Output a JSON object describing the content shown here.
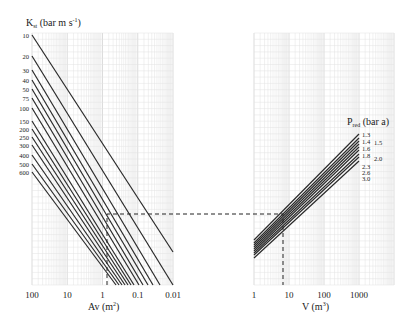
{
  "chart_data": [
    {
      "type": "line",
      "name": "left-panel",
      "title": "",
      "ylabel_main": "K",
      "ylabel_sub": "st",
      "ylabel_unit": "(bar m s",
      "ylabel_exp": "-1",
      "ylabel_close": ")",
      "xlabel_main": "Av (m",
      "xlabel_exp": "2",
      "xlabel_close": ")",
      "x_scale": "log",
      "x_reversed": true,
      "xlim": [
        100,
        0.01
      ],
      "x_ticks": [
        "100",
        "10",
        "1",
        "0.1",
        "0.01"
      ],
      "grid": true,
      "series_labels": [
        "10",
        "20",
        "30",
        "40",
        "50",
        "75",
        "100",
        "150",
        "200",
        "250",
        "300",
        "400",
        "500",
        "600"
      ],
      "series_label_y": [
        35,
        56,
        70,
        80,
        89,
        98,
        108,
        121,
        129,
        137,
        145,
        155,
        164,
        172
      ],
      "series_end": [
        [
          173,
          252
        ],
        [
          173,
          285
        ],
        [
          160,
          285
        ],
        [
          153,
          285
        ],
        [
          148,
          285
        ],
        [
          143,
          285
        ],
        [
          139,
          285
        ],
        [
          134,
          285
        ],
        [
          131,
          285
        ],
        [
          128,
          285
        ],
        [
          125,
          285
        ],
        [
          122,
          285
        ],
        [
          119,
          285
        ],
        [
          116,
          285
        ]
      ]
    },
    {
      "type": "line",
      "name": "right-panel",
      "title": "",
      "xlabel_main": "V (m",
      "xlabel_exp": "3",
      "xlabel_close": ")",
      "x_scale": "log",
      "xlim": [
        1,
        10000
      ],
      "x_ticks": [
        "1",
        "10",
        "100",
        "1000"
      ],
      "grid": true,
      "legend_title_main": "P",
      "legend_title_sub": "red",
      "legend_title_unit": " (bar a)",
      "series": [
        {
          "name": "1.3",
          "y_start": 240,
          "y_end": 134
        },
        {
          "name": "1.4",
          "y_start": 243,
          "y_end": 138
        },
        {
          "name": "1.5",
          "y_start": 245,
          "y_end": 141
        },
        {
          "name": "1.6",
          "y_start": 247,
          "y_end": 144
        },
        {
          "name": "1.8",
          "y_start": 249,
          "y_end": 147
        },
        {
          "name": "2.0",
          "y_start": 251,
          "y_end": 150
        },
        {
          "name": "2.3",
          "y_start": 253,
          "y_end": 154
        },
        {
          "name": "2.6",
          "y_start": 255,
          "y_end": 157
        },
        {
          "name": "3.0",
          "y_start": 258,
          "y_end": 161
        }
      ],
      "legend_main_labels": [
        {
          "text": "1.3",
          "y": 135
        },
        {
          "text": "1.4",
          "y": 142
        },
        {
          "text": "1.6",
          "y": 149
        },
        {
          "text": "1.8",
          "y": 156
        },
        {
          "text": "2.3",
          "y": 167
        },
        {
          "text": "2.6",
          "y": 173
        },
        {
          "text": "3.0",
          "y": 179
        }
      ],
      "legend_side_labels": [
        {
          "text": "1.5",
          "y": 145
        },
        {
          "text": "2.0",
          "y": 161
        }
      ]
    }
  ],
  "nomogram_example": {
    "av_value": "≈0.8 m²",
    "v_value": "≈6 m³"
  }
}
